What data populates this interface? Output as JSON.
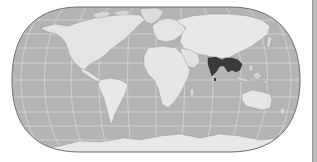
{
  "map": {
    "projection": "robinson-like",
    "style": "grayscale",
    "highlighted_region": "South and Southeast Asia",
    "highlighted_countries": [
      "India",
      "Bangladesh",
      "Myanmar",
      "Thailand",
      "Laos",
      "Cambodia",
      "Vietnam",
      "Nepal",
      "Bhutan",
      "Sri Lanka"
    ],
    "colors": {
      "ocean": "#b4b4b4",
      "land": "#e4e4e4",
      "land_shade": "#cfcfcf",
      "highlight": "#3a3a3a",
      "graticule": "#e8e8e8",
      "outline": "#6e6e6e",
      "sidebar": "#b9b9b9"
    }
  }
}
